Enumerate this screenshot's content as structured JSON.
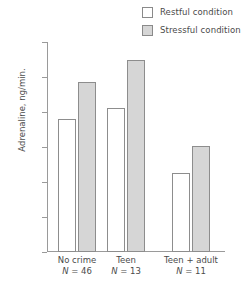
{
  "legend": {
    "items": [
      {
        "label": "Restful condition",
        "swatch": "restful",
        "color": "#ffffff"
      },
      {
        "label": "Stressful condition",
        "swatch": "stressful",
        "color": "#d6d6d6"
      }
    ]
  },
  "axis": {
    "y_title": "Adrenaline, ng/min.",
    "y_ticks": [
      "1500",
      "1250",
      "1000",
      "750",
      "500",
      "250",
      "0"
    ]
  },
  "groups": [
    {
      "name": "No crime",
      "n_label": "N = 46",
      "n_value": 46
    },
    {
      "name": "Teen",
      "n_label": "N = 13",
      "n_value": 13
    },
    {
      "name": "Teen + adult",
      "n_label": "N = 11",
      "n_value": 11
    }
  ],
  "chart_data": {
    "type": "bar",
    "title": "",
    "xlabel": "",
    "ylabel": "Adrenaline, ng/min.",
    "ylim": [
      0,
      1500
    ],
    "ytick_step": 250,
    "grid": false,
    "legend_position": "top-right",
    "categories": [
      "No crime",
      "Teen",
      "Teen + adult"
    ],
    "category_sublabels": [
      "N = 46",
      "N = 13",
      "N = 11"
    ],
    "series": [
      {
        "name": "Restful condition",
        "color": "#ffffff",
        "values": [
          950,
          1030,
          565
        ]
      },
      {
        "name": "Stressful condition",
        "color": "#d6d6d6",
        "values": [
          1215,
          1375,
          760
        ]
      }
    ]
  }
}
